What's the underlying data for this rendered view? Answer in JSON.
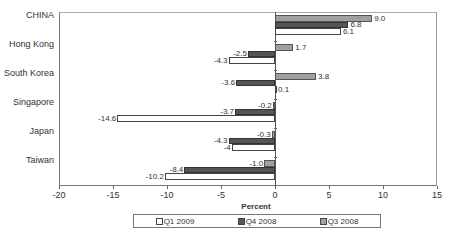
{
  "chart_data": {
    "type": "bar",
    "orientation": "horizontal",
    "title": "",
    "xlabel": "Percent",
    "ylabel": "",
    "xlim": [
      -20,
      15
    ],
    "xticks": [
      -20,
      -15,
      -10,
      -5,
      0,
      5,
      10,
      15
    ],
    "grid": false,
    "legend_position": "bottom",
    "categories": [
      "CHINA",
      "Hong Kong",
      "South Korea",
      "Singapore",
      "Japan",
      "Taiwan"
    ],
    "series": [
      {
        "name": "Q1 2009",
        "color": "#ffffff",
        "values": [
          6.1,
          -4.3,
          0.1,
          -14.6,
          -4,
          -10.2
        ],
        "labels": [
          "6.1",
          "-4.3",
          "0.1",
          "-14.6",
          "-4",
          "-10.2"
        ]
      },
      {
        "name": "Q4 2008",
        "color": "#555555",
        "values": [
          6.8,
          -2.5,
          -3.6,
          -3.7,
          -4.3,
          -8.4
        ],
        "labels": [
          "6.8",
          "-2.5",
          "-3.6",
          "-3.7",
          "-4.3",
          "-8.4"
        ]
      },
      {
        "name": "Q3 2008",
        "color": "#a0a0a0",
        "values": [
          9.0,
          1.7,
          3.8,
          -0.2,
          -0.3,
          -1.0
        ],
        "labels": [
          "9.0",
          "1.7",
          "3.8",
          "-0.2",
          "-0.3",
          "-1.0"
        ]
      }
    ]
  },
  "legend": {
    "items": [
      {
        "label": "Q1 2009",
        "color": "#ffffff"
      },
      {
        "label": "Q4 2008",
        "color": "#555555"
      },
      {
        "label": "Q3 2008",
        "color": "#a0a0a0"
      }
    ]
  }
}
